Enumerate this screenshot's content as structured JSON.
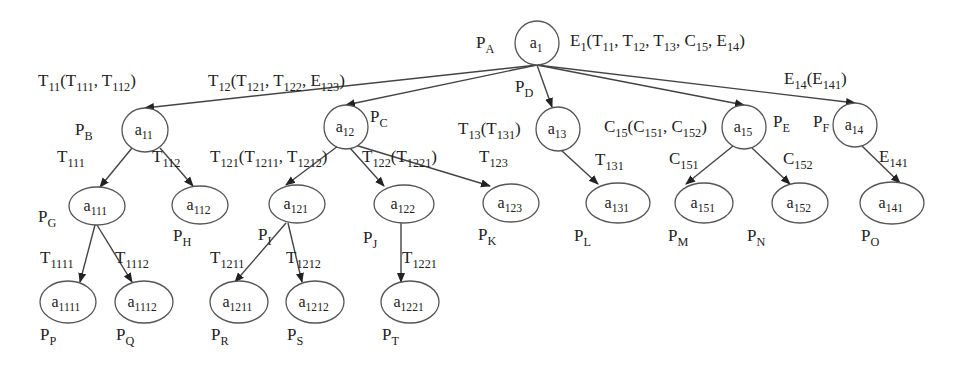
{
  "diagram": {
    "type": "tree",
    "nodes": [
      {
        "id": "a1",
        "name": "a",
        "sub": "1",
        "cx": 537,
        "cy": 43,
        "rx": 22,
        "ry": 22,
        "p": "P",
        "psub": "A",
        "px": 476,
        "py": 48
      },
      {
        "id": "a11",
        "name": "a",
        "sub": "11",
        "cx": 145,
        "cy": 130,
        "rx": 23,
        "ry": 22,
        "p": "P",
        "psub": "B",
        "px": 75,
        "py": 135
      },
      {
        "id": "a12",
        "name": "a",
        "sub": "12",
        "cx": 346,
        "cy": 127,
        "rx": 22,
        "ry": 22,
        "p": "P",
        "psub": "C",
        "px": 370,
        "py": 122
      },
      {
        "id": "a13",
        "name": "a",
        "sub": "13",
        "cx": 558,
        "cy": 129,
        "rx": 22,
        "ry": 22,
        "p": "P",
        "psub": "D",
        "px": 515,
        "py": 92
      },
      {
        "id": "a15",
        "name": "a",
        "sub": "15",
        "cx": 744,
        "cy": 127,
        "rx": 22,
        "ry": 22,
        "p": "P",
        "psub": "E",
        "px": 773,
        "py": 127
      },
      {
        "id": "a14",
        "name": "a",
        "sub": "14",
        "cx": 855,
        "cy": 125,
        "rx": 22,
        "ry": 22,
        "p": "P",
        "psub": "F",
        "px": 813,
        "py": 127
      },
      {
        "id": "a111",
        "name": "a",
        "sub": "111",
        "cx": 97,
        "cy": 206,
        "rx": 28,
        "ry": 19,
        "p": "P",
        "psub": "G",
        "px": 38,
        "py": 222
      },
      {
        "id": "a112",
        "name": "a",
        "sub": "112",
        "cx": 200,
        "cy": 205,
        "rx": 28,
        "ry": 19,
        "p": "P",
        "psub": "H",
        "px": 173,
        "py": 241
      },
      {
        "id": "a121",
        "name": "a",
        "sub": "121",
        "cx": 297,
        "cy": 204,
        "rx": 28,
        "ry": 19,
        "p": "P",
        "psub": "I",
        "px": 258,
        "py": 240
      },
      {
        "id": "a122",
        "name": "a",
        "sub": "122",
        "cx": 404,
        "cy": 204,
        "rx": 30,
        "ry": 19,
        "p": "P",
        "psub": "J",
        "px": 363,
        "py": 243
      },
      {
        "id": "a123",
        "name": "a",
        "sub": "123",
        "cx": 511,
        "cy": 203,
        "rx": 28,
        "ry": 19,
        "p": "P",
        "psub": "K",
        "px": 478,
        "py": 240
      },
      {
        "id": "a131",
        "name": "a",
        "sub": "131",
        "cx": 618,
        "cy": 203,
        "rx": 32,
        "ry": 20,
        "p": "P",
        "psub": "L",
        "px": 574,
        "py": 241
      },
      {
        "id": "a151",
        "name": "a",
        "sub": "151",
        "cx": 704,
        "cy": 203,
        "rx": 29,
        "ry": 20,
        "p": "P",
        "psub": "M",
        "px": 668,
        "py": 241
      },
      {
        "id": "a152",
        "name": "a",
        "sub": "152",
        "cx": 800,
        "cy": 203,
        "rx": 28,
        "ry": 20,
        "p": "P",
        "psub": "N",
        "px": 747,
        "py": 241
      },
      {
        "id": "a141",
        "name": "a",
        "sub": "141",
        "cx": 892,
        "cy": 203,
        "rx": 32,
        "ry": 21,
        "p": "P",
        "psub": "O",
        "px": 861,
        "py": 241
      },
      {
        "id": "a1111",
        "name": "a",
        "sub": "1111",
        "cx": 68,
        "cy": 302,
        "rx": 28,
        "ry": 21,
        "p": "P",
        "psub": "P",
        "px": 40,
        "py": 340
      },
      {
        "id": "a1112",
        "name": "a",
        "sub": "1112",
        "cx": 144,
        "cy": 302,
        "rx": 29,
        "ry": 21,
        "p": "P",
        "psub": "Q",
        "px": 116,
        "py": 340
      },
      {
        "id": "a1211",
        "name": "a",
        "sub": "1211",
        "cx": 239,
        "cy": 302,
        "rx": 29,
        "ry": 21,
        "p": "P",
        "psub": "R",
        "px": 211,
        "py": 340
      },
      {
        "id": "a1212",
        "name": "a",
        "sub": "1212",
        "cx": 315,
        "cy": 302,
        "rx": 29,
        "ry": 21,
        "p": "P",
        "psub": "S",
        "px": 287,
        "py": 340
      },
      {
        "id": "a1221",
        "name": "a",
        "sub": "1221",
        "cx": 410,
        "cy": 302,
        "rx": 29,
        "ry": 21,
        "p": "P",
        "psub": "T",
        "px": 382,
        "py": 340
      }
    ],
    "edges": [
      {
        "from": "a1",
        "to": "a11",
        "x1": 537,
        "y1": 65,
        "x2": 145,
        "y2": 108
      },
      {
        "from": "a1",
        "to": "a12",
        "x1": 537,
        "y1": 65,
        "x2": 346,
        "y2": 105
      },
      {
        "from": "a1",
        "to": "a13",
        "x1": 537,
        "y1": 65,
        "x2": 552,
        "y2": 107
      },
      {
        "from": "a1",
        "to": "a15",
        "x1": 537,
        "y1": 65,
        "x2": 744,
        "y2": 105
      },
      {
        "from": "a1",
        "to": "a14",
        "x1": 537,
        "y1": 65,
        "x2": 855,
        "y2": 103
      },
      {
        "from": "a11",
        "to": "a111",
        "x1": 132,
        "y1": 148,
        "x2": 100,
        "y2": 187
      },
      {
        "from": "a11",
        "to": "a112",
        "x1": 160,
        "y1": 148,
        "x2": 193,
        "y2": 186
      },
      {
        "from": "a12",
        "to": "a121",
        "x1": 338,
        "y1": 146,
        "x2": 286,
        "y2": 185
      },
      {
        "from": "a12",
        "to": "a122",
        "x1": 350,
        "y1": 148,
        "x2": 384,
        "y2": 186
      },
      {
        "from": "a12",
        "to": "a123",
        "x1": 355,
        "y1": 145,
        "x2": 490,
        "y2": 186
      },
      {
        "from": "a13",
        "to": "a131",
        "x1": 561,
        "y1": 150,
        "x2": 598,
        "y2": 184
      },
      {
        "from": "a15",
        "to": "a151",
        "x1": 733,
        "y1": 146,
        "x2": 686,
        "y2": 184
      },
      {
        "from": "a15",
        "to": "a152",
        "x1": 752,
        "y1": 148,
        "x2": 790,
        "y2": 184
      },
      {
        "from": "a14",
        "to": "a141",
        "x1": 862,
        "y1": 146,
        "x2": 900,
        "y2": 183
      },
      {
        "from": "a111",
        "to": "a1111",
        "x1": 95,
        "y1": 225,
        "x2": 80,
        "y2": 282
      },
      {
        "from": "a111",
        "to": "a1112",
        "x1": 97,
        "y1": 225,
        "x2": 132,
        "y2": 282
      },
      {
        "from": "a121",
        "to": "a1211",
        "x1": 286,
        "y1": 223,
        "x2": 235,
        "y2": 282
      },
      {
        "from": "a121",
        "to": "a1212",
        "x1": 288,
        "y1": 223,
        "x2": 302,
        "y2": 282
      },
      {
        "from": "a122",
        "to": "a1221",
        "x1": 401,
        "y1": 223,
        "x2": 401,
        "y2": 282
      }
    ],
    "edge_labels": [
      {
        "id": "E1",
        "x": 570,
        "y": 46,
        "parts": [
          [
            "E",
            ""
          ],
          [
            "",
            "1"
          ],
          [
            "(T",
            ""
          ],
          [
            "",
            "11"
          ],
          [
            ", T",
            ""
          ],
          [
            "",
            "12"
          ],
          [
            ", T",
            ""
          ],
          [
            "",
            "13"
          ],
          [
            ", C",
            ""
          ],
          [
            "",
            "15"
          ],
          [
            ", E",
            ""
          ],
          [
            "",
            "14"
          ],
          [
            ")",
            ""
          ]
        ]
      },
      {
        "id": "T11",
        "x": 38,
        "y": 86,
        "parts": [
          [
            "T",
            ""
          ],
          [
            "",
            "11"
          ],
          [
            "(T",
            ""
          ],
          [
            "",
            "111"
          ],
          [
            ", T",
            ""
          ],
          [
            "",
            "112"
          ],
          [
            ")",
            ""
          ]
        ]
      },
      {
        "id": "T12",
        "x": 208,
        "y": 86,
        "parts": [
          [
            "T",
            ""
          ],
          [
            "",
            "12"
          ],
          [
            "(T",
            ""
          ],
          [
            "",
            "121"
          ],
          [
            ", T",
            ""
          ],
          [
            "",
            "122"
          ],
          [
            ", E",
            ""
          ],
          [
            "",
            "123"
          ],
          [
            ")",
            ""
          ]
        ]
      },
      {
        "id": "T13",
        "x": 458,
        "y": 134,
        "parts": [
          [
            "T",
            ""
          ],
          [
            "",
            "13"
          ],
          [
            "(T",
            ""
          ],
          [
            "",
            "131"
          ],
          [
            ")",
            ""
          ]
        ]
      },
      {
        "id": "C15",
        "x": 604,
        "y": 132,
        "parts": [
          [
            "C",
            ""
          ],
          [
            "",
            "15"
          ],
          [
            "(C",
            ""
          ],
          [
            "",
            "151"
          ],
          [
            ", C",
            ""
          ],
          [
            "",
            "152"
          ],
          [
            ")",
            ""
          ]
        ]
      },
      {
        "id": "E14",
        "x": 784,
        "y": 84,
        "parts": [
          [
            "E",
            ""
          ],
          [
            "",
            "14"
          ],
          [
            "(E",
            ""
          ],
          [
            "",
            "141"
          ],
          [
            ")",
            ""
          ]
        ]
      },
      {
        "id": "T111",
        "x": 57,
        "y": 162,
        "parts": [
          [
            "T",
            ""
          ],
          [
            "",
            "111"
          ]
        ]
      },
      {
        "id": "T112",
        "x": 152,
        "y": 162,
        "parts": [
          [
            "T",
            ""
          ],
          [
            "",
            "112"
          ]
        ]
      },
      {
        "id": "T121",
        "x": 210,
        "y": 162,
        "parts": [
          [
            "T",
            ""
          ],
          [
            "",
            "121"
          ],
          [
            "(T",
            ""
          ],
          [
            "",
            "1211"
          ],
          [
            ", T",
            ""
          ],
          [
            "",
            "1212"
          ],
          [
            ")",
            ""
          ]
        ]
      },
      {
        "id": "T122",
        "x": 362,
        "y": 162,
        "parts": [
          [
            "T",
            ""
          ],
          [
            "",
            "122"
          ],
          [
            "(T",
            ""
          ],
          [
            "",
            "1221"
          ],
          [
            ")",
            ""
          ]
        ]
      },
      {
        "id": "T123",
        "x": 479,
        "y": 162,
        "parts": [
          [
            "T",
            ""
          ],
          [
            "",
            "123"
          ]
        ]
      },
      {
        "id": "T131",
        "x": 595,
        "y": 165,
        "parts": [
          [
            "T",
            ""
          ],
          [
            "",
            "131"
          ]
        ]
      },
      {
        "id": "C151",
        "x": 669,
        "y": 164,
        "parts": [
          [
            "C",
            ""
          ],
          [
            "",
            "151"
          ]
        ]
      },
      {
        "id": "C152",
        "x": 783,
        "y": 164,
        "parts": [
          [
            "C",
            ""
          ],
          [
            "",
            "152"
          ]
        ]
      },
      {
        "id": "E141",
        "x": 879,
        "y": 162,
        "parts": [
          [
            "E",
            ""
          ],
          [
            "",
            "141"
          ]
        ]
      },
      {
        "id": "T1111",
        "x": 40,
        "y": 263,
        "parts": [
          [
            "T",
            ""
          ],
          [
            "",
            "1111"
          ]
        ]
      },
      {
        "id": "T1112",
        "x": 115,
        "y": 263,
        "parts": [
          [
            "T",
            ""
          ],
          [
            "",
            "1112"
          ]
        ]
      },
      {
        "id": "T1211",
        "x": 210,
        "y": 263,
        "parts": [
          [
            "T",
            ""
          ],
          [
            "",
            "1211"
          ]
        ]
      },
      {
        "id": "T1212",
        "x": 286,
        "y": 263,
        "parts": [
          [
            "T",
            ""
          ],
          [
            "",
            "1212"
          ]
        ]
      },
      {
        "id": "T1221",
        "x": 402,
        "y": 263,
        "parts": [
          [
            "T",
            ""
          ],
          [
            "",
            "1221"
          ]
        ]
      }
    ]
  },
  "colors": {
    "stroke": "#555555",
    "edge": "#444444",
    "text": "#222222",
    "background": "#ffffff"
  }
}
